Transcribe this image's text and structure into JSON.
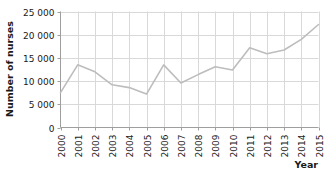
{
  "chart_data": {
    "type": "line",
    "title": "",
    "xlabel": "Year",
    "ylabel": "Number of nurses",
    "categories": [
      "2000",
      "2001",
      "2002",
      "2003",
      "2004",
      "2005",
      "2006",
      "2007",
      "2008",
      "2009",
      "2010",
      "2011",
      "2012",
      "2013",
      "2014",
      "2015"
    ],
    "values": [
      7500,
      13500,
      12000,
      9200,
      8600,
      7200,
      13500,
      9600,
      11400,
      13100,
      12400,
      17200,
      15900,
      16700,
      19000,
      22200
    ],
    "series": [
      {
        "name": "Number of nurses",
        "values": [
          7500,
          13500,
          12000,
          9200,
          8600,
          7200,
          13500,
          9600,
          11400,
          13100,
          12400,
          17200,
          15900,
          16700,
          19000,
          22200
        ]
      }
    ],
    "x": [
      2000,
      2001,
      2002,
      2003,
      2004,
      2005,
      2006,
      2007,
      2008,
      2009,
      2010,
      2011,
      2012,
      2013,
      2014,
      2015
    ],
    "ylim": [
      0,
      25000
    ],
    "xlim": [
      2000,
      2015
    ],
    "yticks": [
      0,
      5000,
      10000,
      15000,
      20000,
      25000
    ],
    "ytick_labels": [
      "0",
      "5 000",
      "10 000",
      "15 000",
      "20 000",
      "25 000"
    ],
    "xtick_labels": [
      "2000",
      "2001",
      "2002",
      "2003",
      "2004",
      "2005",
      "2006",
      "2007",
      "2008",
      "2009",
      "2010",
      "2011",
      "2012",
      "2013",
      "2014",
      "2015"
    ],
    "grid": true,
    "grid_axes": "both",
    "legend": false,
    "legend_position": "none",
    "line_color": "#bdbdbd",
    "grid_color": "#d9d9d9",
    "axis_color": "#9e9e9e",
    "text_color": "#1a1a1a",
    "background_color": "#ffffff",
    "xlabel_rotation": 90
  },
  "labels": {
    "y_axis_title": "Number of nurses",
    "x_axis_title": "Year",
    "ytick_0": "0",
    "ytick_1": "5 000",
    "ytick_2": "10 000",
    "ytick_3": "15 000",
    "ytick_4": "20 000",
    "ytick_5": "25 000",
    "xtick_0": "2000",
    "xtick_1": "2001",
    "xtick_2": "2002",
    "xtick_3": "2003",
    "xtick_4": "2004",
    "xtick_5": "2005",
    "xtick_6": "2006",
    "xtick_7": "2007",
    "xtick_8": "2008",
    "xtick_9": "2009",
    "xtick_10": "2010",
    "xtick_11": "2011",
    "xtick_12": "2012",
    "xtick_13": "2013",
    "xtick_14": "2014",
    "xtick_15": "2015"
  }
}
